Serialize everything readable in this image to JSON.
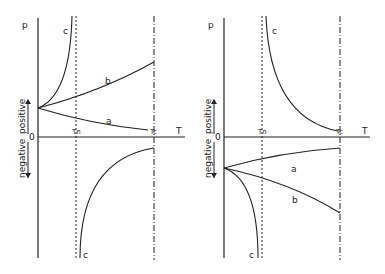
{
  "figure": {
    "panels": [
      {
        "id": "left",
        "y_axis_label": "p",
        "x_axis_label": "T",
        "origin_label": "0",
        "vertical_label_negative": "negative",
        "vertical_label_positive": "positive",
        "tn_label": "Tn",
        "tc_label": "Tc",
        "curves": [
          {
            "label": "a",
            "description": "positive branch decreasing from start point toward Tc"
          },
          {
            "label": "b",
            "description": "positive branch increasing from start point toward Tc"
          },
          {
            "label": "c",
            "description": "upper branch diverging to +inf near Tn"
          },
          {
            "label": "c",
            "description": "lower branch from -inf near Tn rising toward Tc"
          }
        ]
      },
      {
        "id": "right",
        "y_axis_label": "p",
        "x_axis_label": "T",
        "origin_label": "0",
        "vertical_label_negative": "negative",
        "vertical_label_positive": "positive",
        "tn_label": "Tn",
        "tc_label": "Tc",
        "curves": [
          {
            "label": "c",
            "description": "upper branch from +inf near Tn decaying toward Tc"
          },
          {
            "label": "a",
            "description": "negative branch rising from start point toward Tc"
          },
          {
            "label": "b",
            "description": "negative branch falling from start point toward Tc"
          },
          {
            "label": "c",
            "description": "lower branch diverging to -inf near Tn"
          }
        ]
      }
    ]
  }
}
